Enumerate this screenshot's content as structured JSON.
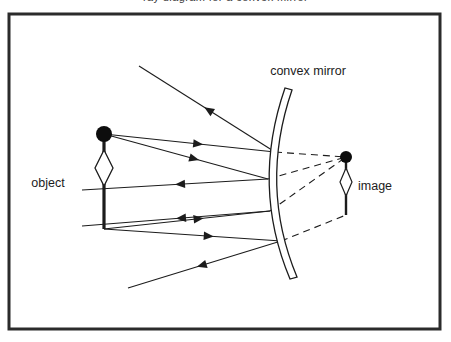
{
  "figure": {
    "kind": "ray-diagram",
    "clipped_caption": "ray diagram for a convex mirror",
    "background_color": "#ffffff",
    "stroke_color": "#1c1c1c",
    "frame": {
      "color": "#2b2b2b",
      "x": 9,
      "y": 14,
      "width": 431,
      "height": 315,
      "stroke_width": 3
    }
  },
  "labels": {
    "mirror": "convex mirror",
    "object": "object",
    "image": "image"
  },
  "objects": {
    "object_arrow": {
      "name": "object",
      "tip_x": 104,
      "tip_y": 134,
      "base_x": 104,
      "base_y": 229,
      "head_radius": 8,
      "diamond_half_width": 9,
      "diamond_top": 150,
      "diamond_bottom": 186
    },
    "image_arrow": {
      "name": "image",
      "tip_x": 346,
      "tip_y": 157,
      "base_x": 346,
      "base_y": 215,
      "head_radius": 6,
      "diamond_half_width": 6,
      "diamond_top": 168,
      "diamond_bottom": 196
    },
    "mirror": {
      "name": "convex mirror",
      "top_x": 285,
      "top_y": 88,
      "mid_x": 265,
      "mid_y": 186,
      "bottom_x": 290,
      "bottom_y": 279,
      "thickness": 5
    }
  },
  "rays": {
    "incident": [
      {
        "from": [
          104,
          134
        ],
        "to": [
          275,
          152
        ],
        "arrow_at": 0.58
      },
      {
        "from": [
          104,
          134
        ],
        "to": [
          268,
          179
        ],
        "arrow_at": 0.58
      },
      {
        "from": [
          104,
          229
        ],
        "to": [
          270,
          211
        ],
        "arrow_at": 0.6
      },
      {
        "from": [
          104,
          229
        ],
        "to": [
          281,
          241
        ],
        "arrow_at": 0.62
      }
    ],
    "reflected": [
      {
        "from": [
          275,
          152
        ],
        "to": [
          139,
          66
        ],
        "arrow_at": 0.52
      },
      {
        "from": [
          268,
          179
        ],
        "to": [
          82,
          190
        ],
        "arrow_at": 0.5
      },
      {
        "from": [
          270,
          211
        ],
        "to": [
          82,
          226
        ],
        "arrow_at": 0.5
      },
      {
        "from": [
          281,
          241
        ],
        "to": [
          128,
          288
        ],
        "arrow_at": 0.55
      }
    ],
    "virtual_dashed": [
      {
        "from": [
          275,
          152
        ],
        "to": [
          346,
          157
        ]
      },
      {
        "from": [
          268,
          179
        ],
        "to": [
          346,
          157
        ]
      },
      {
        "from": [
          270,
          211
        ],
        "to": [
          346,
          157
        ]
      },
      {
        "from": [
          281,
          241
        ],
        "to": [
          346,
          215
        ]
      }
    ],
    "image_link": {
      "from": [
        281,
        241
      ],
      "to": [
        346,
        215
      ]
    }
  },
  "label_positions": {
    "mirror": {
      "x": 308,
      "y": 75
    },
    "object": {
      "x": 48,
      "y": 187
    },
    "image": {
      "x": 358,
      "y": 190
    }
  }
}
